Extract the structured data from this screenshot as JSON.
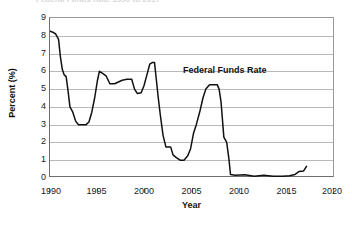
{
  "chart_data": {
    "type": "line",
    "title": "Federal Funds Rate 1990 to 2017",
    "xlabel": "Year",
    "ylabel": "Percent (%)",
    "xlim": [
      1990,
      2020
    ],
    "ylim": [
      0,
      9
    ],
    "xticks": [
      "1990",
      "1995",
      "2000",
      "2005",
      "2010",
      "2015",
      "2020"
    ],
    "yticks": [
      "0",
      "1",
      "2",
      "3",
      "4",
      "5",
      "6",
      "7",
      "8",
      "9"
    ],
    "grid": "horizontal",
    "legend_position": "inline-annotation",
    "annotations": [
      {
        "text": "Federal Funds Rate",
        "x": 2005.2,
        "y": 6.45
      }
    ],
    "series": [
      {
        "name": "Federal Funds Rate",
        "color": "#111111",
        "x": [
          1990.0,
          1990.3,
          1990.6,
          1990.9,
          1991.1,
          1991.3,
          1991.5,
          1991.7,
          1991.9,
          1992.1,
          1992.4,
          1992.7,
          1993.0,
          1993.4,
          1993.8,
          1994.1,
          1994.4,
          1994.7,
          1995.0,
          1995.2,
          1995.5,
          1995.9,
          1996.3,
          1996.8,
          1997.2,
          1997.6,
          1998.1,
          1998.6,
          1998.9,
          1999.2,
          1999.6,
          1999.9,
          2000.2,
          2000.5,
          2000.8,
          2001.0,
          2001.2,
          2001.4,
          2001.6,
          2001.9,
          2002.2,
          2002.7,
          2002.95,
          2003.3,
          2003.7,
          2004.1,
          2004.5,
          2004.8,
          2005.1,
          2005.4,
          2005.8,
          2006.1,
          2006.4,
          2006.8,
          2007.2,
          2007.6,
          2007.8,
          2008.0,
          2008.3,
          2008.6,
          2008.85,
          2009.0,
          2009.5,
          2010.5,
          2011.5,
          2012.5,
          2013.5,
          2014.5,
          2015.2,
          2015.8,
          2016.2,
          2016.7,
          2017.0
        ],
        "y": [
          8.25,
          8.2,
          8.1,
          7.8,
          6.8,
          6.1,
          5.8,
          5.7,
          4.9,
          4.0,
          3.7,
          3.2,
          3.0,
          3.0,
          3.0,
          3.15,
          3.7,
          4.5,
          5.5,
          6.0,
          5.9,
          5.75,
          5.3,
          5.3,
          5.4,
          5.5,
          5.55,
          5.55,
          5.0,
          4.75,
          4.8,
          5.2,
          5.8,
          6.4,
          6.5,
          6.5,
          5.5,
          4.5,
          3.6,
          2.4,
          1.75,
          1.75,
          1.3,
          1.15,
          1.0,
          1.0,
          1.25,
          1.65,
          2.5,
          3.0,
          3.8,
          4.5,
          5.0,
          5.25,
          5.25,
          5.25,
          5.0,
          4.3,
          2.3,
          2.0,
          1.0,
          0.2,
          0.15,
          0.18,
          0.1,
          0.15,
          0.1,
          0.1,
          0.13,
          0.2,
          0.36,
          0.4,
          0.66
        ]
      }
    ]
  }
}
